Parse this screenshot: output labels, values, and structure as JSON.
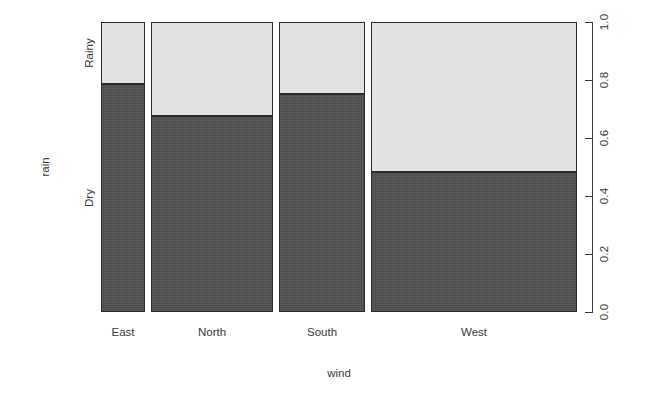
{
  "chart_data": {
    "type": "bar",
    "subtype": "mosaic-spineplot",
    "title": "",
    "subtitle": "",
    "xlabel": "wind",
    "ylabel": "rain",
    "categories": [
      "East",
      "North",
      "South",
      "West"
    ],
    "response_levels": [
      "Dry",
      "Rainy"
    ],
    "grid": false,
    "legend": "none",
    "ylim": [
      0.0,
      1.0
    ],
    "y_ticks": [
      "0.0",
      "0.2",
      "0.4",
      "0.6",
      "0.8",
      "1.0"
    ],
    "y_tick_values": [
      0.0,
      0.2,
      0.4,
      0.6,
      0.8,
      1.0
    ],
    "y_axis_position": "right",
    "y_category_labels": [
      "Dry",
      "Rainy"
    ],
    "column_widths": [
      0.096,
      0.266,
      0.188,
      0.449
    ],
    "series": [
      {
        "name": "Dry",
        "values": [
          0.786,
          0.676,
          0.752,
          0.483
        ]
      },
      {
        "name": "Rainy",
        "values": [
          0.214,
          0.324,
          0.248,
          0.517
        ]
      }
    ],
    "columns": [
      {
        "category": "East",
        "width_fraction": 0.096,
        "dry": 0.786,
        "rainy": 0.214
      },
      {
        "category": "North",
        "width_fraction": 0.266,
        "dry": 0.676,
        "rainy": 0.324
      },
      {
        "category": "South",
        "width_fraction": 0.188,
        "dry": 0.752,
        "rainy": 0.248
      },
      {
        "category": "West",
        "width_fraction": 0.449,
        "dry": 0.483,
        "rainy": 0.517
      }
    ],
    "colors": {
      "dry_fill": "#4a4a4a",
      "rainy_fill": "#e9e9e9",
      "border": "#2b2b2b",
      "axis": "#3a3a3a",
      "background": "#ffffff"
    }
  }
}
